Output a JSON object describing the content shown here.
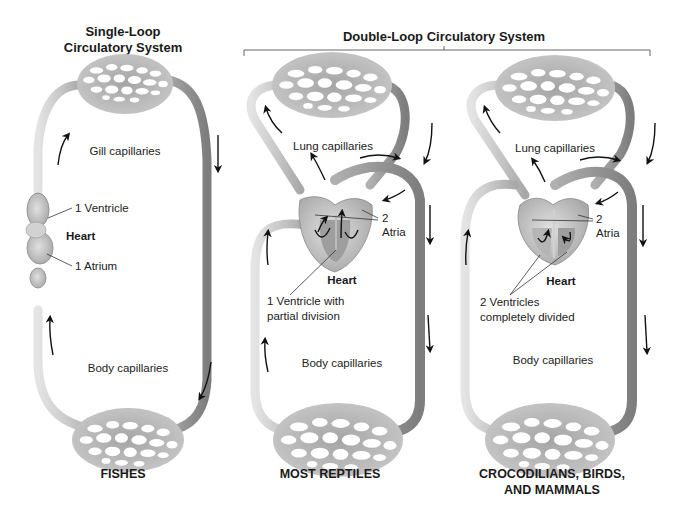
{
  "titles": {
    "single_loop_line1": "Single-Loop",
    "single_loop_line2": "Circulatory System",
    "double_loop": "Double-Loop Circulatory System"
  },
  "panels": [
    {
      "id": "fishes",
      "caption_line1": "FISHES",
      "caption_line2": "",
      "top_capillaries_label": "Gill capillaries",
      "bottom_capillaries_label": "Body capillaries",
      "heart_label": "Heart",
      "heart_parts": [
        "1 Ventricle",
        "1 Atrium"
      ]
    },
    {
      "id": "most-reptiles",
      "caption_line1": "MOST REPTILES",
      "caption_line2": "",
      "top_capillaries_label": "Lung capillaries",
      "bottom_capillaries_label": "Body capillaries",
      "heart_label": "Heart",
      "atria_label_line1": "2",
      "atria_label_line2": "Atria",
      "ventricle_label_line1": "1 Ventricle with",
      "ventricle_label_line2": "partial division"
    },
    {
      "id": "crocodilians-birds-mammals",
      "caption_line1": "CROCODILIANS, BIRDS,",
      "caption_line2": "AND MAMMALS",
      "top_capillaries_label": "Lung capillaries",
      "bottom_capillaries_label": "Body capillaries",
      "heart_label": "Heart",
      "atria_label_line1": "2",
      "atria_label_line2": "Atria",
      "ventricle_label_line1": "2 Ventricles",
      "ventricle_label_line2": "completely divided"
    }
  ],
  "colors": {
    "vessel_light": "#d4d4d4",
    "vessel_dark": "#9a9a9a",
    "capillary_fill": "#b8b8b8",
    "heart_fill": "#c8c8c8",
    "text": "#1a1a1a",
    "arrow": "#111111"
  }
}
